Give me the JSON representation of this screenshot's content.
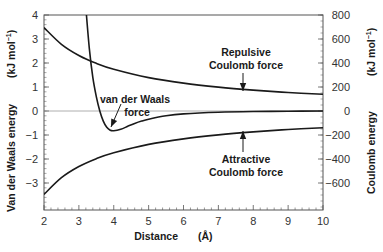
{
  "chart_data": {
    "type": "line",
    "title": "",
    "xlabel": "Distance",
    "xlabel_unit": "(Å)",
    "ylabel_left": "Van der Waals energy",
    "ylabel_left_unit": "(kJ mol⁻¹)",
    "ylabel_right": "Coulomb energy",
    "ylabel_right_unit": "(kJ mol⁻¹)",
    "xlim": [
      2,
      10
    ],
    "ylim_left": [
      -4.1,
      4
    ],
    "ylim_right": [
      -820,
      800
    ],
    "x_ticks": [
      "2",
      "3",
      "4",
      "5",
      "6",
      "7",
      "8",
      "9",
      "10"
    ],
    "y_left_ticks": [
      "4",
      "3",
      "2",
      "1",
      "0",
      "-1",
      "-2",
      "-3"
    ],
    "y_right_ticks": [
      "800",
      "600",
      "400",
      "200",
      "0",
      "-200",
      "-400",
      "-600"
    ],
    "grid": false,
    "zero_line": true,
    "series": [
      {
        "name": "van der Waals force",
        "axis": "left",
        "x": [
          3.2,
          3.3,
          3.4,
          3.5,
          3.6,
          3.7,
          3.8,
          3.9,
          4.0,
          4.2,
          4.4,
          4.6,
          4.8,
          5.0,
          5.5,
          6.0,
          7.0,
          8.0,
          9.0,
          10.0
        ],
        "values": [
          4.3,
          2.6,
          1.4,
          0.6,
          0.0,
          -0.42,
          -0.68,
          -0.8,
          -0.82,
          -0.76,
          -0.64,
          -0.52,
          -0.42,
          -0.34,
          -0.2,
          -0.12,
          -0.05,
          -0.02,
          -0.01,
          0.0
        ]
      },
      {
        "name": "Repulsive Coulomb force",
        "axis": "right",
        "x": [
          2,
          2.5,
          3,
          3.5,
          4,
          5,
          6,
          7,
          8,
          9,
          10
        ],
        "values": [
          695,
          556,
          463,
          397,
          348,
          278,
          232,
          199,
          174,
          154,
          139
        ]
      },
      {
        "name": "Attractive Coulomb force",
        "axis": "right",
        "x": [
          2,
          2.5,
          3,
          3.5,
          4,
          5,
          6,
          7,
          8,
          9,
          10
        ],
        "values": [
          -695,
          -556,
          -463,
          -397,
          -348,
          -278,
          -232,
          -199,
          -174,
          -154,
          -139
        ]
      }
    ],
    "annotations": [
      {
        "text": [
          "Repulsive",
          "Coulomb force"
        ],
        "arrow_to": [
          7.8,
          160
        ],
        "axis": "right"
      },
      {
        "text": [
          "van der Waals",
          "force"
        ],
        "arrow_to": [
          3.9,
          -0.8
        ],
        "axis": "left"
      },
      {
        "text": [
          "Attractive",
          "Coulomb force"
        ],
        "arrow_to": [
          7.8,
          -160
        ],
        "axis": "right"
      }
    ]
  },
  "labels": {
    "x_title": "Distance",
    "x_unit": "(Å)",
    "y_left_title": "Van der Waals energy",
    "y_left_unit": "(kJ mol",
    "y_right_title": "Coulomb energy",
    "y_right_unit": "(kJ mol",
    "unit_sup": "−1",
    "rep_line1": "Repulsive",
    "rep_line2": "Coulomb force",
    "vdw_line1": "van der Waals",
    "vdw_line2": "force",
    "att_line1": "Attractive",
    "att_line2": "Coulomb force"
  },
  "colors": {
    "curve": "#1a1a1a",
    "frame": "#555555",
    "zero_line": "#999999"
  }
}
